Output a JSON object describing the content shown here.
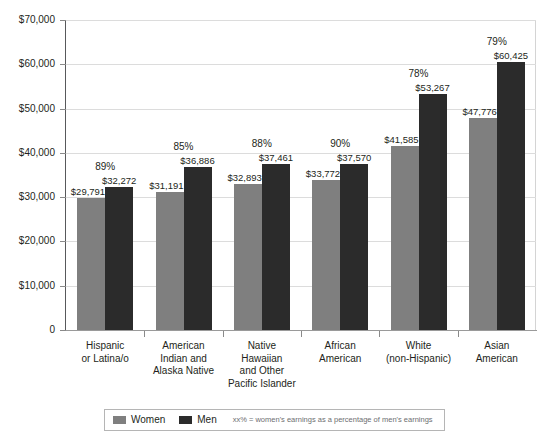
{
  "chart_data": {
    "type": "bar",
    "title": "",
    "xlabel": "",
    "ylabel": "",
    "ylim": [
      0,
      70000
    ],
    "grid": true,
    "legend_position": "bottom",
    "ytick_labels": [
      "$70,000",
      "$60,000",
      "$50,000",
      "$40,000",
      "$30,000",
      "$20,000",
      "$10,000",
      "0"
    ],
    "ytick_values": [
      70000,
      60000,
      50000,
      40000,
      30000,
      20000,
      10000,
      0
    ],
    "categories": [
      "Hispanic\nor Latina/o",
      "American\nIndian and\nAlaska Native",
      "Native\nHawaiian\nand Other\nPacific Islander",
      "African\nAmerican",
      "White\n(non-Hispanic)",
      "Asian\nAmerican"
    ],
    "series": [
      {
        "name": "Women",
        "color": "#7f7f7f",
        "values": [
          29791,
          32893,
          32893,
          33772,
          41585,
          47776
        ],
        "value_labels": [
          "$29,791",
          "$31,191",
          "$32,893",
          "$33,772",
          "$41,585",
          "$47,776"
        ],
        "values_exact": [
          29791,
          31191,
          32893,
          33772,
          41585,
          47776
        ]
      },
      {
        "name": "Men",
        "color": "#2b2b2b",
        "values": [
          32272,
          36886,
          37461,
          37570,
          53267,
          60425
        ],
        "value_labels": [
          "$32,272",
          "$36,886",
          "$37,461",
          "$37,570",
          "$53,267",
          "$60,425"
        ],
        "values_exact": [
          32272,
          36886,
          37461,
          37570,
          53267,
          60425
        ]
      }
    ],
    "ratio_labels": [
      "89%",
      "85%",
      "88%",
      "90%",
      "78%",
      "79%"
    ],
    "annotations": []
  },
  "legend": {
    "women_label": "Women",
    "men_label": "Men",
    "note": "xx% = women's earnings as a percentage of men's earnings"
  },
  "top_clip": {
    "text": ""
  }
}
